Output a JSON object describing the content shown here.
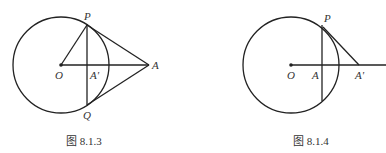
{
  "figures": [
    {
      "caption": "图 8.1.3",
      "labels": {
        "P": "P",
        "O": "O",
        "A_prime": "A'",
        "A": "A",
        "Q": "Q"
      },
      "geometry": {
        "circle": {
          "cx": 61,
          "cy": 65,
          "r": 48
        },
        "O": [
          61,
          65
        ],
        "P": [
          87,
          25
        ],
        "Q": [
          87,
          105
        ],
        "A": [
          149,
          65
        ],
        "A_prime": [
          87,
          65
        ]
      }
    },
    {
      "caption": "图 8.1.4",
      "labels": {
        "P": "P",
        "O": "O",
        "A": "A",
        "A_prime": "A'"
      },
      "geometry": {
        "circle": {
          "cx": 291,
          "cy": 65,
          "r": 48
        },
        "O": [
          291,
          65
        ],
        "P": [
          323,
          27
        ],
        "A": [
          322,
          65
        ],
        "A_prime": [
          359,
          65
        ],
        "ray_end": [
          386,
          65
        ]
      }
    }
  ]
}
